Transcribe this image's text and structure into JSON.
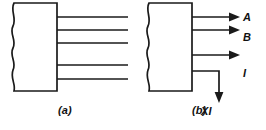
{
  "figure": {
    "background_color": "#ffffff",
    "ink_color": "#1a1a1a",
    "panels": [
      {
        "id": "a",
        "caption": "(a)",
        "block": {
          "name": "torn-edge-block",
          "left_edge_style": "wavy",
          "x": 12,
          "y": 3,
          "width": 45,
          "height": 88
        },
        "lines": [
          {
            "name": "bus-line-1",
            "y": 17,
            "x_start": 57,
            "x_end": 128,
            "arrow": "none",
            "label": ""
          },
          {
            "name": "bus-line-2",
            "y": 30,
            "x_start": 57,
            "x_end": 128,
            "arrow": "none",
            "label": ""
          },
          {
            "name": "bus-line-3",
            "y": 43,
            "x_start": 57,
            "x_end": 128,
            "arrow": "none",
            "label": ""
          },
          {
            "name": "bus-line-4",
            "y": 65,
            "x_start": 57,
            "x_end": 128,
            "arrow": "none",
            "label": ""
          },
          {
            "name": "bus-line-5",
            "y": 79,
            "x_start": 57,
            "x_end": 128,
            "arrow": "none",
            "label": ""
          }
        ]
      },
      {
        "id": "b",
        "caption": "(b)",
        "block": {
          "name": "torn-edge-block",
          "left_edge_style": "wavy",
          "x": 147,
          "y": 3,
          "width": 45,
          "height": 88
        },
        "lines": [
          {
            "name": "signal-line-A",
            "y": 17,
            "x_start": 192,
            "x_end": 237,
            "arrow": "right",
            "label": "A"
          },
          {
            "name": "signal-line-B",
            "y": 30,
            "x_start": 192,
            "x_end": 237,
            "arrow": "right",
            "label": "B"
          },
          {
            "name": "signal-line-I",
            "y": 55,
            "x_start": 192,
            "x_end": 237,
            "arrow": "right",
            "label": "I"
          },
          {
            "name": "signal-line-XI",
            "y": 71,
            "x_start": 192,
            "x_end": 219,
            "arrow": "down",
            "drop_to_y": 100,
            "label": "XI"
          }
        ]
      }
    ],
    "labels": {
      "A": "A",
      "B": "B",
      "I": "I",
      "XI": "XI"
    },
    "captions": {
      "a": "(a)",
      "b": "(b)"
    }
  }
}
